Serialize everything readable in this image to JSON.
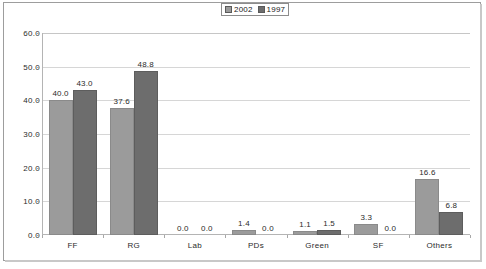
{
  "chart_data": {
    "type": "bar",
    "title": "",
    "subtitle": "",
    "xlabel": "",
    "ylabel": "",
    "categories": [
      "FF",
      "RG",
      "Lab",
      "PDs",
      "Green",
      "SF",
      "Others"
    ],
    "series": [
      {
        "name": "2002",
        "color": "#9b9b9b",
        "values": [
          40.0,
          37.6,
          0.0,
          1.4,
          1.1,
          3.3,
          16.6
        ],
        "labels": [
          "40.0",
          "37.6",
          "0.0",
          "1.4",
          "1.1",
          "3.3",
          "16.6"
        ]
      },
      {
        "name": "1997",
        "color": "#6d6d6d",
        "values": [
          43.0,
          48.8,
          0.0,
          0.0,
          1.5,
          0.0,
          6.8
        ],
        "labels": [
          "43.0",
          "48.8",
          "0.0",
          "0.0",
          "1.5",
          "0.0",
          "6.8"
        ]
      }
    ],
    "ylim": [
      0.0,
      60.0
    ],
    "ytick_values": [
      0.0,
      10.0,
      20.0,
      30.0,
      40.0,
      50.0,
      60.0
    ],
    "ytick_labels": [
      "0.0",
      "10.0",
      "20.0",
      "30.0",
      "40.0",
      "50.0",
      "60.0"
    ],
    "grid": true,
    "grid_axis": "y",
    "legend": {
      "position": "top-right",
      "entries": [
        {
          "label": "2002",
          "color": "#9b9b9b"
        },
        {
          "label": "1997",
          "color": "#6d6d6d"
        }
      ]
    },
    "data_labels": true
  }
}
